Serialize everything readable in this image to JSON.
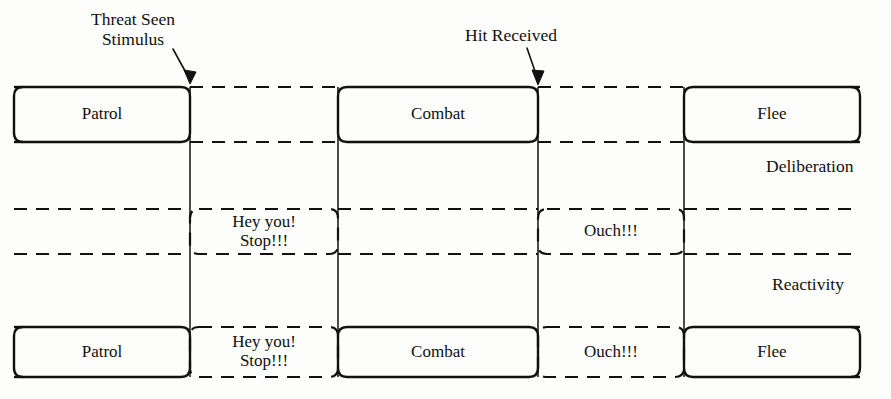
{
  "diagram": {
    "title_present": false,
    "stroke_color": "#111111",
    "background_color": "#fdfdfb",
    "annotations": [
      {
        "name": "threat-seen-stimulus",
        "text": "Threat Seen\nStimulus",
        "x": 74,
        "y": 10,
        "target_x": 190,
        "target_y": 86
      },
      {
        "name": "hit-received",
        "text": "Hit Received",
        "x": 452,
        "y": 26,
        "target_x": 538,
        "target_y": 86
      }
    ],
    "band_labels": [
      {
        "name": "deliberation",
        "text": "Deliberation",
        "x": 766,
        "y": 157
      },
      {
        "name": "reactivity",
        "text": "Reactivity",
        "x": 772,
        "y": 275
      }
    ],
    "bands": [
      {
        "name": "deliberation-band",
        "label": "Deliberation",
        "top": 87,
        "bottom": 142,
        "states": [
          {
            "name": "patrol",
            "text": "Patrol",
            "x1": 14,
            "x2": 190,
            "style": "solid"
          },
          {
            "name": "combat",
            "text": "Combat",
            "x1": 338,
            "x2": 538,
            "style": "solid"
          },
          {
            "name": "flee",
            "text": "Flee",
            "x1": 684,
            "x2": 860,
            "style": "solid"
          }
        ],
        "gaps": [
          {
            "x1": 190,
            "x2": 338,
            "style": "dashed"
          },
          {
            "x1": 538,
            "x2": 684,
            "style": "dashed"
          }
        ]
      },
      {
        "name": "reactivity-band",
        "label": "Reactivity",
        "top": 209,
        "bottom": 254,
        "states": [
          {
            "name": "hey-you-stop",
            "text": "Hey you!\nStop!!!",
            "x1": 190,
            "x2": 338,
            "style": "dashed-box"
          },
          {
            "name": "ouch",
            "text": "Ouch!!!",
            "x1": 538,
            "x2": 684,
            "style": "dashed-box"
          }
        ],
        "gaps": [
          {
            "x1": 14,
            "x2": 190,
            "style": "dashed"
          },
          {
            "x1": 338,
            "x2": 538,
            "style": "dashed"
          },
          {
            "x1": 684,
            "x2": 860,
            "style": "dashed"
          }
        ]
      },
      {
        "name": "combined-band",
        "label": "",
        "top": 327,
        "bottom": 377,
        "states": [
          {
            "name": "patrol-combined",
            "text": "Patrol",
            "x1": 14,
            "x2": 190,
            "style": "solid"
          },
          {
            "name": "hey-you-stop-combined",
            "text": "Hey you!\nStop!!!",
            "x1": 190,
            "x2": 338,
            "style": "dashed-box"
          },
          {
            "name": "combat-combined",
            "text": "Combat",
            "x1": 338,
            "x2": 538,
            "style": "solid"
          },
          {
            "name": "ouch-combined",
            "text": "Ouch!!!",
            "x1": 538,
            "x2": 684,
            "style": "dashed-box"
          },
          {
            "name": "flee-combined",
            "text": "Flee",
            "x1": 684,
            "x2": 860,
            "style": "solid"
          }
        ],
        "gaps": []
      }
    ],
    "dividers": [
      {
        "name": "divider-threat-seen",
        "x": 190,
        "y1": 87,
        "y2": 377
      },
      {
        "name": "divider-combat-start",
        "x": 338,
        "y1": 87,
        "y2": 377
      },
      {
        "name": "divider-hit-received",
        "x": 538,
        "y1": 87,
        "y2": 377
      },
      {
        "name": "divider-flee-start",
        "x": 684,
        "y1": 87,
        "y2": 377
      }
    ]
  }
}
